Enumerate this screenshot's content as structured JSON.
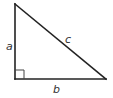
{
  "diagram": {
    "type": "right-triangle",
    "vertices": {
      "top": {
        "x": 15,
        "y": 4
      },
      "right_angle": {
        "x": 15,
        "y": 79
      },
      "right": {
        "x": 106,
        "y": 79
      }
    },
    "right_angle_marker_size": 9,
    "labels": {
      "a": {
        "text": "a",
        "x": 6,
        "y": 50,
        "side": "vertical leg"
      },
      "b": {
        "text": "b",
        "x": 53,
        "y": 93,
        "side": "horizontal leg"
      },
      "c": {
        "text": "c",
        "x": 65,
        "y": 43,
        "side": "hypotenuse"
      }
    },
    "colors": {
      "stroke": "#222222",
      "label": "#333333",
      "background": "#ffffff"
    }
  }
}
